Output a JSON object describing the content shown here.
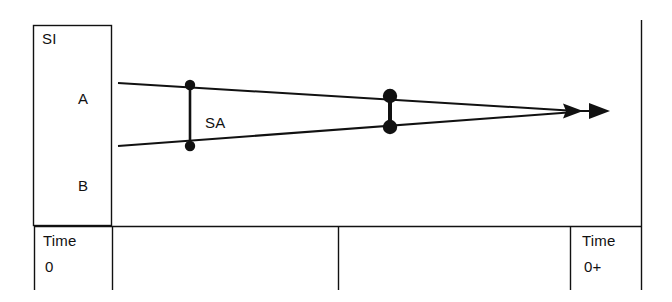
{
  "figure": {
    "type": "timeline-schematic",
    "background_color": "#ffffff",
    "ink_color": "#111111"
  },
  "legend_box": {
    "name": "si-box",
    "title": "SI",
    "rows": [
      {
        "label": "A"
      },
      {
        "label": "B"
      }
    ]
  },
  "annotations": {
    "span_label": "SA"
  },
  "axis": {
    "left_tick": {
      "word": "Time",
      "value": "0"
    },
    "right_tick": {
      "word": "Time",
      "value": "0+"
    }
  },
  "geometry": {
    "box": {
      "x": 33,
      "y": 25,
      "width": 79,
      "height": 201
    },
    "baseline_y": 226,
    "bottom_y": 290,
    "right_rule_x": 641,
    "right_rule_top_y": 20,
    "dividers_x": [
      34,
      112,
      338,
      570,
      641
    ],
    "upper_ray": {
      "x1": 118,
      "y1": 83,
      "x2": 566,
      "y2": 111
    },
    "lower_ray": {
      "x1": 118,
      "y1": 146,
      "x2": 566,
      "y2": 113
    },
    "markers": [
      {
        "name": "marker-pair-1",
        "x": 190,
        "top_y": 85,
        "bottom_y": 146,
        "radius": 5
      },
      {
        "name": "marker-pair-2",
        "x": 390,
        "top_y": 96,
        "bottom_y": 127,
        "radius": 7
      }
    ],
    "arrowheads": [
      {
        "name": "arrowhead-inner",
        "tip_x": 583,
        "y": 111
      },
      {
        "name": "arrowhead-outer",
        "tip_x": 610,
        "y": 111
      }
    ]
  }
}
